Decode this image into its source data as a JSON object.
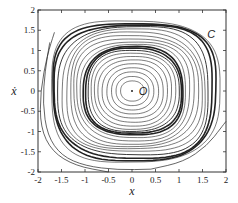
{
  "chart_data": {
    "type": "line",
    "title": "",
    "xlabel": "x",
    "ylabel": "ẋ",
    "xlim": [
      -2,
      2
    ],
    "ylim": [
      -2,
      2
    ],
    "grid": false,
    "xticks": [
      -2,
      -1.5,
      -1,
      -0.5,
      0,
      0.5,
      1,
      1.5,
      2
    ],
    "yticks": [
      -2,
      -1.5,
      -1,
      -0.5,
      0,
      0.5,
      1,
      1.5,
      2
    ],
    "xtick_labels": [
      "-2",
      "-1.5",
      "-1",
      "-0.5",
      "0",
      "0.5",
      "1",
      "1.5",
      "2"
    ],
    "ytick_labels": [
      "-2",
      "-1.5",
      "-1",
      "-0.5",
      "0",
      "0.5",
      "1",
      "1.5",
      "2"
    ],
    "annotations": [
      {
        "text": "O",
        "x": 0.1,
        "y": 0.0,
        "note": "equilibrium point (center)"
      },
      {
        "text": "C",
        "x": 1.6,
        "y": 1.4,
        "note": "outer limit cycle label"
      }
    ],
    "equilibrium": {
      "x": 0,
      "y": 0
    },
    "closed_orbits": [
      {
        "rx": 0.25,
        "ry": 0.25,
        "weight": "thin"
      },
      {
        "rx": 0.35,
        "ry": 0.36,
        "weight": "thin"
      },
      {
        "rx": 0.45,
        "ry": 0.47,
        "weight": "thin"
      },
      {
        "rx": 0.55,
        "ry": 0.57,
        "weight": "thin"
      },
      {
        "rx": 0.65,
        "ry": 0.67,
        "weight": "thin"
      },
      {
        "rx": 0.74,
        "ry": 0.77,
        "weight": "thin"
      },
      {
        "rx": 0.82,
        "ry": 0.86,
        "weight": "thin"
      },
      {
        "rx": 0.9,
        "ry": 0.94,
        "weight": "thin"
      },
      {
        "rx": 0.97,
        "ry": 1.0,
        "weight": "medium"
      },
      {
        "rx": 1.02,
        "ry": 1.05,
        "weight": "thick"
      },
      {
        "rx": 1.06,
        "ry": 1.09,
        "weight": "thick"
      },
      {
        "rx": 1.12,
        "ry": 1.15,
        "weight": "thin"
      },
      {
        "rx": 1.2,
        "ry": 1.22,
        "weight": "thin"
      },
      {
        "rx": 1.28,
        "ry": 1.3,
        "weight": "thin"
      },
      {
        "rx": 1.36,
        "ry": 1.37,
        "weight": "thin"
      },
      {
        "rx": 1.44,
        "ry": 1.44,
        "weight": "thin"
      },
      {
        "rx": 1.52,
        "ry": 1.51,
        "weight": "thin"
      },
      {
        "rx": 1.6,
        "ry": 1.58,
        "weight": "medium"
      },
      {
        "rx": 1.68,
        "ry": 1.64,
        "weight": "thick"
      },
      {
        "rx": 1.73,
        "ry": 1.69,
        "weight": "thick"
      },
      {
        "rx": 1.79,
        "ry": 1.74,
        "weight": "thin"
      }
    ],
    "open_trajectories": [
      {
        "name": "outer-left-lower",
        "points": [
          [
            -1.75,
            1.2
          ],
          [
            -1.85,
            0.5
          ],
          [
            -1.9,
            -0.3
          ],
          [
            -1.8,
            -1.1
          ],
          [
            -1.5,
            -1.6
          ],
          [
            -1.0,
            -1.85
          ],
          [
            -0.3,
            -1.95
          ],
          [
            0.4,
            -1.93
          ]
        ]
      },
      {
        "name": "outer-right-lower",
        "points": [
          [
            0.4,
            -1.93
          ],
          [
            1.1,
            -1.75
          ],
          [
            1.6,
            -1.35
          ],
          [
            1.9,
            -0.9
          ],
          [
            2.0,
            -0.75
          ]
        ]
      },
      {
        "name": "outer-left-entry",
        "points": [
          [
            -1.65,
            1.45
          ],
          [
            -1.8,
            0.9
          ],
          [
            -1.95,
            0.0
          ],
          [
            -1.95,
            -0.9
          ],
          [
            -1.7,
            -1.5
          ],
          [
            -1.2,
            -1.85
          ],
          [
            -0.5,
            -2.0
          ]
        ]
      }
    ]
  }
}
